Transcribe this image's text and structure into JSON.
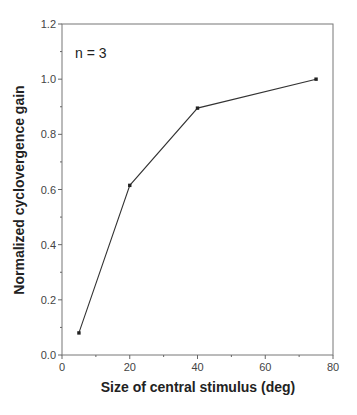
{
  "chart_data": {
    "type": "line",
    "title": "",
    "xlabel": "Size of central stimulus (deg)",
    "ylabel": "Normalized cyclovergence gain",
    "xlim": [
      0,
      80
    ],
    "ylim": [
      0.0,
      1.2
    ],
    "x_ticks": [
      "0",
      "20",
      "40",
      "60",
      "80"
    ],
    "y_ticks": [
      "0.0",
      "0.2",
      "0.4",
      "0.6",
      "0.8",
      "1.0",
      "1.2"
    ],
    "grid": false,
    "legend": null,
    "annotation": "n = 3",
    "series": [
      {
        "name": "cyclovergence gain",
        "x": [
          5,
          20,
          40,
          75
        ],
        "y": [
          0.08,
          0.615,
          0.895,
          1.0
        ]
      }
    ]
  }
}
